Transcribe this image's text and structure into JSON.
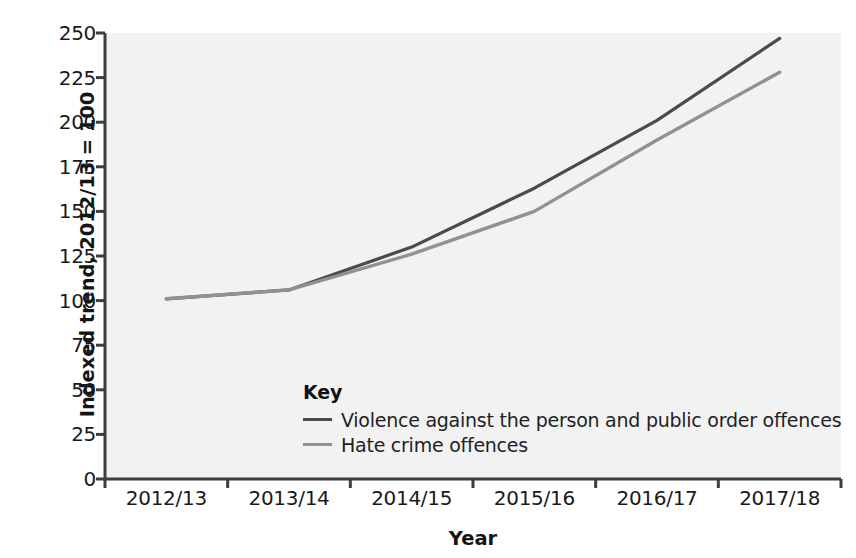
{
  "chart_data": {
    "type": "line",
    "title": "",
    "xlabel": "Year",
    "ylabel": "Indexed trend, 2012/13 = 100",
    "categories": [
      "2012/13",
      "2013/14",
      "2014/15",
      "2015/16",
      "2016/17",
      "2017/18"
    ],
    "yticks": [
      0,
      25,
      50,
      75,
      100,
      125,
      150,
      175,
      200,
      225,
      250
    ],
    "ylim": [
      0,
      250
    ],
    "grid": false,
    "legend_position": "inside-lower-center",
    "legend_title": "Key",
    "series": [
      {
        "name": "Violence against the person and public order offences",
        "color": "#4a4a4a",
        "values": [
          101,
          106,
          130,
          163,
          201,
          247
        ]
      },
      {
        "name": "Hate crime offences",
        "color": "#919191",
        "values": [
          101,
          106,
          126,
          150,
          190,
          228
        ]
      }
    ]
  },
  "axes": {
    "y_title": "Indexed trend, 2012/13 = 100",
    "x_title": "Year",
    "ytick_labels": [
      "250",
      "225",
      "200",
      "175",
      "150",
      "125",
      "100",
      "75",
      "50",
      "25",
      "0"
    ],
    "xtick_labels": [
      "2012/13",
      "2013/14",
      "2014/15",
      "2015/16",
      "2016/17",
      "2017/18"
    ]
  },
  "legend": {
    "title": "Key",
    "items": [
      {
        "label": "Violence against the person and public order offences",
        "color": "#4a4a4a"
      },
      {
        "label": "Hate crime offences",
        "color": "#919191"
      }
    ]
  },
  "style": {
    "axis_color": "#3d3d3d",
    "plot_background": "#f2f2f2",
    "page_background": "#ffffff"
  }
}
